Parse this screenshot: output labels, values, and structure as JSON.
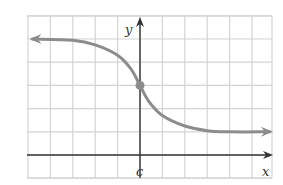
{
  "chart_data": {
    "type": "line",
    "title": "",
    "xlabel": "x",
    "ylabel": "y",
    "x_tick_labels": [
      {
        "position": 0,
        "label": "c"
      }
    ],
    "grid": true,
    "grid_columns": 11,
    "grid_rows": 7,
    "series": [
      {
        "name": "f(x)",
        "points_grid_units": [
          [
            -4.8,
            5
          ],
          [
            -3,
            4.95
          ],
          [
            -2,
            4.75
          ],
          [
            -1,
            4.3
          ],
          [
            -0.4,
            3.7
          ],
          [
            0,
            3
          ],
          [
            0.4,
            2.3
          ],
          [
            1,
            1.7
          ],
          [
            2,
            1.25
          ],
          [
            3,
            1.05
          ],
          [
            4,
            1.0
          ],
          [
            5.8,
            1.0
          ]
        ],
        "left_asymptote_y": 5,
        "right_asymptote_y": 1,
        "marked_point": {
          "x": 0,
          "y": 3,
          "label": "(c, f(c))"
        },
        "arrows": [
          "left",
          "right"
        ]
      }
    ],
    "xlim": [
      -5,
      6
    ],
    "ylim": [
      -1,
      6
    ]
  },
  "labels": {
    "x_axis": "x",
    "y_axis": "y",
    "c_tick": "c"
  },
  "colors": {
    "grid": "#d4d4d4",
    "axes": "#333333",
    "curve": "#8c8c8c",
    "point": "#8c8c8c"
  }
}
